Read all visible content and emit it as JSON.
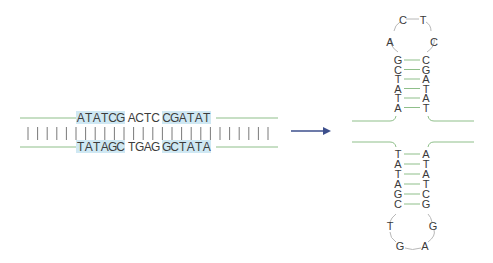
{
  "colors": {
    "strand_line": "#8fbf8a",
    "highlight": "#cfe8f3",
    "arrow": "#3d4f8c",
    "text": "#3a3a3a",
    "loop_line": "#b8b8b8",
    "bars": "#7a7a7a"
  },
  "duplex": {
    "top_strand": {
      "segments": [
        {
          "text": "ATATCG",
          "highlighted": true
        },
        {
          "text": "ACTC",
          "highlighted": false
        },
        {
          "text": "CGATAT",
          "highlighted": true
        }
      ]
    },
    "bottom_strand": {
      "segments": [
        {
          "text": "TATAGC",
          "highlighted": true
        },
        {
          "text": "TGAG",
          "highlighted": false
        },
        {
          "text": "GCTATA",
          "highlighted": true
        }
      ]
    },
    "pairing_bar_count": 26
  },
  "arrow": {
    "icon": "right-arrow-icon",
    "direction": "right"
  },
  "hairpin_top": {
    "loop": [
      "A",
      "C",
      "T",
      "C"
    ],
    "stem_pairs": [
      [
        "G",
        "C"
      ],
      [
        "C",
        "G"
      ],
      [
        "T",
        "A"
      ],
      [
        "A",
        "T"
      ],
      [
        "T",
        "A"
      ],
      [
        "A",
        "T"
      ]
    ]
  },
  "hairpin_bottom": {
    "stem_pairs": [
      [
        "T",
        "A"
      ],
      [
        "A",
        "T"
      ],
      [
        "T",
        "A"
      ],
      [
        "A",
        "T"
      ],
      [
        "G",
        "C"
      ],
      [
        "C",
        "G"
      ]
    ],
    "loop": [
      "T",
      "G",
      "A",
      "G"
    ]
  }
}
